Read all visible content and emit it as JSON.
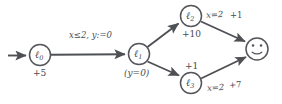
{
  "figure": {
    "kind": "weighted-timed-automaton-diagram",
    "background_color": "#ffffff",
    "stroke_color": "#53555a",
    "text_color": "#4a4c50"
  },
  "nodes": [
    {
      "id": "l0",
      "label": "ℓ",
      "subscript": "0",
      "below_label": "+5",
      "cx": 40,
      "cy": 55,
      "r": 10.5,
      "initial": true
    },
    {
      "id": "l1",
      "label": "ℓ",
      "subscript": "1",
      "below_label": "(y=0)",
      "cx": 139,
      "cy": 54,
      "r": 10.5,
      "initial": false
    },
    {
      "id": "l2",
      "label": "ℓ",
      "subscript": "2",
      "below_label": "+10",
      "cx": 191,
      "cy": 16,
      "r": 10.5,
      "initial": false
    },
    {
      "id": "l3",
      "label": "ℓ",
      "subscript": "3",
      "below_label": "+1",
      "cx": 191,
      "cy": 83,
      "r": 10.5,
      "initial": false
    },
    {
      "id": "goal",
      "label": "☺",
      "subscript": "",
      "below_label": "",
      "cx": 257,
      "cy": 49,
      "r": 11,
      "initial": false,
      "smiley": true
    }
  ],
  "edges": [
    {
      "id": "init-to-l0",
      "from": "start",
      "to": "l0",
      "label": ""
    },
    {
      "id": "l0-to-l1",
      "from": "l0",
      "to": "l1",
      "label": "x≤2, y:=0"
    },
    {
      "id": "l1-to-l2",
      "from": "l1",
      "to": "l2",
      "label": ""
    },
    {
      "id": "l1-to-l3",
      "from": "l1",
      "to": "l3",
      "label": ""
    },
    {
      "id": "l2-to-goal",
      "from": "l2",
      "to": "goal",
      "guard": "x=2",
      "weight": "+1"
    },
    {
      "id": "l3-to-goal",
      "from": "l3",
      "to": "goal",
      "guard": "x=2",
      "weight": "+7"
    }
  ],
  "labels": {
    "l0_name": "ℓ",
    "l0_sub": "0",
    "l0_cost": "+5",
    "l1_name": "ℓ",
    "l1_sub": "1",
    "l1_invariant": "(y=0)",
    "l2_name": "ℓ",
    "l2_sub": "2",
    "l2_cost": "+10",
    "l3_name": "ℓ",
    "l3_sub": "3",
    "l3_cost": "+1",
    "transition_guard_reset": "x≤2, y:=0",
    "top_guard": "x=2",
    "top_weight": "+1",
    "bottom_guard": "x=2",
    "bottom_weight": "+7"
  }
}
